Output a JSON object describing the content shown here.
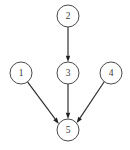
{
  "diagram": {
    "type": "directed-graph",
    "canvas": {
      "width": 130,
      "height": 150,
      "background": "#ffffff"
    },
    "style": {
      "node_fill": "#ffffff",
      "node_stroke": "#4a4a4a",
      "node_radius": 11,
      "label_color": "#3a3a3a",
      "edge_color": "#2b2b2b",
      "arrowhead_color": "#1f1f1f"
    },
    "nodes": [
      {
        "id": "1",
        "label": "1",
        "cx": 21,
        "cy": 73,
        "r": 11
      },
      {
        "id": "2",
        "label": "2",
        "cx": 68,
        "cy": 16,
        "r": 11
      },
      {
        "id": "3",
        "label": "3",
        "cx": 68,
        "cy": 73,
        "r": 11
      },
      {
        "id": "4",
        "label": "4",
        "cx": 111,
        "cy": 73,
        "r": 11
      },
      {
        "id": "5",
        "label": "5",
        "cx": 68,
        "cy": 130,
        "r": 11
      }
    ],
    "edges": [
      {
        "id": "e-2-3",
        "from": "2",
        "to": "3",
        "label": "2 to 3",
        "directed": true,
        "x1": 68,
        "y1": 27,
        "x2": 68,
        "y2": 62
      },
      {
        "id": "e-3-5",
        "from": "3",
        "to": "5",
        "label": "3 to 5",
        "directed": true,
        "x1": 68,
        "y1": 84,
        "x2": 68,
        "y2": 119
      },
      {
        "id": "e-1-5",
        "from": "1",
        "to": "5",
        "label": "1 to 5",
        "directed": true,
        "x1": 27.5,
        "y1": 81.9,
        "x2": 58.8,
        "y2": 123.9
      },
      {
        "id": "e-4-5",
        "from": "4",
        "to": "5",
        "label": "4 to 5",
        "directed": true,
        "x1": 104.2,
        "y1": 81.7,
        "x2": 76.7,
        "y2": 123.1
      }
    ]
  }
}
